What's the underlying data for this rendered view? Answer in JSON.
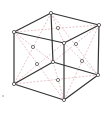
{
  "diagram": {
    "colors": {
      "edge": "#333333",
      "diagonal": "#d89aa4",
      "atom_stroke": "#444444",
      "face_atom_stroke": "#555555",
      "background": "#ffffff"
    },
    "corners": {
      "top_back": [
        51,
        13
      ],
      "top_left": [
        14,
        32
      ],
      "top_right": [
        99,
        25
      ],
      "top_front": [
        64,
        43
      ],
      "bottom_back": [
        53,
        62
      ],
      "bottom_left": [
        14,
        84
      ],
      "bottom_right": [
        98,
        75
      ],
      "bottom_front": [
        64,
        100
      ]
    },
    "face_centers": [
      {
        "face": "top",
        "pos": [
          58,
          28
        ]
      },
      {
        "face": "left-front",
        "pos": [
          33,
          47
        ]
      },
      {
        "face": "right-front",
        "pos": [
          76,
          44
        ]
      },
      {
        "face": "left-back",
        "pos": [
          37,
          64
        ]
      },
      {
        "face": "right-back",
        "pos": [
          82,
          61
        ]
      },
      {
        "face": "bottom",
        "pos": [
          58,
          80
        ]
      }
    ]
  }
}
